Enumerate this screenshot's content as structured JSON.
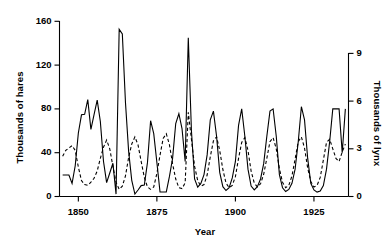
{
  "chart_data": {
    "type": "line",
    "title": "",
    "xlabel": "Year",
    "ylabel": "Thousands of hares",
    "ylabel_right": "Thousands of lynx",
    "xlim": [
      1844,
      1936
    ],
    "ylim": [
      0,
      168
    ],
    "ylim_right": [
      0,
      9.9
    ],
    "grid": false,
    "legend": "none",
    "xticks": [
      1850,
      1875,
      1900,
      1925
    ],
    "xtick_labels": [
      "1850",
      "1875",
      "1900",
      "1925"
    ],
    "yticks": [
      0,
      40,
      80,
      120,
      160
    ],
    "ytick_labels": [
      "0",
      "40",
      "80",
      "120",
      "160"
    ],
    "yticks_right": [
      0,
      3,
      6,
      9
    ],
    "ytick_labels_right": [
      "0",
      "3",
      "6",
      "9"
    ],
    "x": [
      1845,
      1846,
      1847,
      1848,
      1849,
      1850,
      1851,
      1852,
      1853,
      1854,
      1855,
      1856,
      1857,
      1858,
      1859,
      1860,
      1861,
      1862,
      1863,
      1864,
      1865,
      1866,
      1867,
      1868,
      1869,
      1870,
      1871,
      1872,
      1873,
      1874,
      1875,
      1876,
      1877,
      1878,
      1879,
      1880,
      1881,
      1882,
      1883,
      1884,
      1885,
      1886,
      1887,
      1888,
      1889,
      1890,
      1891,
      1892,
      1893,
      1894,
      1895,
      1896,
      1897,
      1898,
      1899,
      1900,
      1901,
      1902,
      1903,
      1904,
      1905,
      1906,
      1907,
      1908,
      1909,
      1910,
      1911,
      1912,
      1913,
      1914,
      1915,
      1916,
      1917,
      1918,
      1919,
      1920,
      1921,
      1922,
      1923,
      1924,
      1925,
      1926,
      1927,
      1928,
      1929,
      1930,
      1931,
      1932,
      1933,
      1934,
      1935
    ],
    "series": [
      {
        "name": "hares",
        "axis": "left",
        "style": "solid",
        "color": "#000000",
        "units": "thousands",
        "values": [
          19.58,
          19.6,
          19.61,
          11.99,
          28.04,
          58.0,
          74.6,
          75.09,
          88.48,
          61.28,
          74.67,
          88.06,
          68.51,
          32.19,
          12.64,
          21.49,
          30.35,
          2.18,
          152.65,
          148.36,
          85.81,
          41.41,
          14.75,
          2.28,
          5.91,
          9.95,
          10.44,
          30.93,
          69.25,
          57.44,
          31.02,
          4.14,
          4.15,
          4.16,
          18.35,
          34.84,
          66.68,
          75.58,
          62.04,
          32.06,
          145.0,
          60.0,
          16.0,
          8.5,
          12.0,
          20.0,
          38.0,
          70.0,
          78.0,
          55.0,
          22.0,
          9.0,
          5.5,
          8.0,
          17.0,
          32.0,
          65.0,
          80.0,
          55.0,
          25.0,
          9.5,
          6.0,
          9.0,
          16.0,
          30.0,
          55.0,
          78.0,
          80.0,
          55.0,
          20.0,
          8.0,
          4.5,
          6.5,
          12.0,
          25.0,
          50.0,
          82.0,
          70.0,
          35.0,
          12.0,
          6.0,
          4.0,
          5.0,
          10.0,
          25.0,
          50.0,
          80.0,
          80.0,
          80.0,
          40.0,
          80.0
        ]
      },
      {
        "name": "lynx",
        "axis": "right",
        "style": "dashed",
        "color": "#000000",
        "units": "thousands",
        "values": [
          2.53,
          2.9,
          3.05,
          3.2,
          2.9,
          1.85,
          1.0,
          0.75,
          0.7,
          0.9,
          1.15,
          1.6,
          2.4,
          3.1,
          3.55,
          3.0,
          1.9,
          0.9,
          0.45,
          0.65,
          1.3,
          2.45,
          3.3,
          3.75,
          3.25,
          2.2,
          1.2,
          0.6,
          0.45,
          0.6,
          1.45,
          2.6,
          3.65,
          3.95,
          3.25,
          2.05,
          1.1,
          0.55,
          0.5,
          0.85,
          5.3,
          3.6,
          1.9,
          1.0,
          0.65,
          0.75,
          1.35,
          2.5,
          3.5,
          3.75,
          2.9,
          1.7,
          0.85,
          0.55,
          0.7,
          1.25,
          2.4,
          3.4,
          3.7,
          2.9,
          1.6,
          0.85,
          0.6,
          0.8,
          1.4,
          2.4,
          3.45,
          3.7,
          3.0,
          1.75,
          0.9,
          0.55,
          0.7,
          1.3,
          2.35,
          3.45,
          3.75,
          3.05,
          1.8,
          0.95,
          0.6,
          0.7,
          1.2,
          2.3,
          3.4,
          3.6,
          3.0,
          2.4,
          2.2,
          2.8,
          3.3
        ]
      }
    ]
  },
  "axes": {
    "left_title": "Thousands of hares",
    "right_title": "Thousands of lynx",
    "x_title": "Year"
  }
}
